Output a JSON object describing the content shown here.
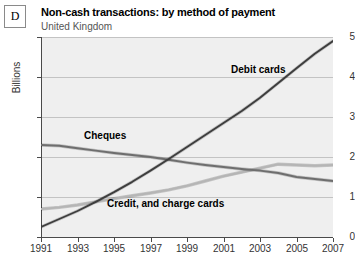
{
  "figure": {
    "letter": "D",
    "title": "Non-cash transactions: by method of payment",
    "subtitle": "United Kingdom"
  },
  "axes": {
    "y_title": "Billions",
    "y_ticks": [
      "0",
      "1",
      "2",
      "3",
      "4",
      "5"
    ],
    "x_ticks": [
      "1991",
      "1993",
      "1995",
      "1997",
      "1999",
      "2001",
      "2003",
      "2005",
      "2007"
    ]
  },
  "series_labels": {
    "debit": "Debit cards",
    "cheques": "Cheques",
    "credit": "Credit, and charge cards"
  },
  "colors": {
    "plot_background": "#efefef",
    "gridline": "#c3c3c3",
    "axis": "#4a4a4a",
    "debit": "#3d3d3d",
    "cheques": "#6e6e6e",
    "credit": "#b5b5b5",
    "text": "#1a1a1a"
  },
  "chart_data": {
    "type": "line",
    "title": "Non-cash transactions: by method of payment",
    "subtitle": "United Kingdom",
    "xlabel": "",
    "ylabel": "Billions",
    "xlim": [
      1991,
      2007
    ],
    "ylim": [
      0,
      5
    ],
    "grid": true,
    "legend": "inline-labels",
    "x": [
      1991,
      1992,
      1993,
      1994,
      1995,
      1996,
      1997,
      1998,
      1999,
      2000,
      2001,
      2002,
      2003,
      2004,
      2005,
      2006,
      2007
    ],
    "series": [
      {
        "name": "Debit cards",
        "color": "#3d3d3d",
        "values": [
          0.25,
          0.45,
          0.65,
          0.88,
          1.12,
          1.38,
          1.66,
          1.95,
          2.25,
          2.55,
          2.85,
          3.15,
          3.48,
          3.85,
          4.22,
          4.58,
          4.9
        ]
      },
      {
        "name": "Cheques",
        "color": "#6e6e6e",
        "values": [
          2.3,
          2.28,
          2.22,
          2.16,
          2.1,
          2.05,
          2.0,
          1.93,
          1.86,
          1.8,
          1.75,
          1.7,
          1.66,
          1.6,
          1.5,
          1.45,
          1.4
        ]
      },
      {
        "name": "Credit, and charge cards",
        "color": "#b5b5b5",
        "values": [
          0.7,
          0.74,
          0.8,
          0.88,
          0.96,
          1.03,
          1.1,
          1.18,
          1.28,
          1.4,
          1.52,
          1.62,
          1.72,
          1.82,
          1.8,
          1.78,
          1.8
        ]
      }
    ]
  }
}
